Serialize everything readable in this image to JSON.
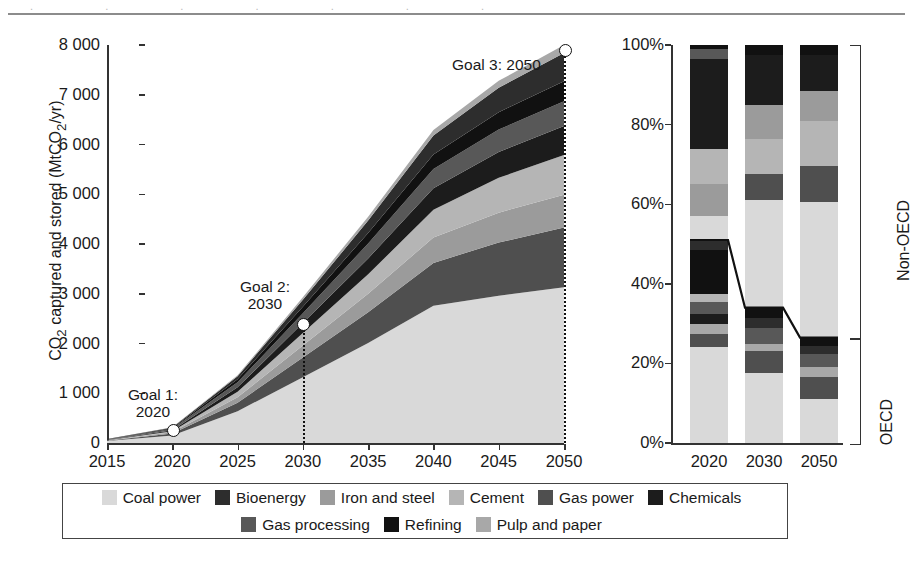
{
  "chart_data": [
    {
      "type": "area",
      "id": "cumulative-ccs-deployment",
      "title": "",
      "xlabel": "",
      "ylabel": "CO2 captured and stored (MtCO2/yr)",
      "ylabel_parts": {
        "pre": "CO",
        "sub1": "2",
        "mid": " captured and stored (MtCO",
        "sub2": "2",
        "post": "/yr)"
      },
      "xlim": [
        2015,
        2050
      ],
      "ylim": [
        0,
        8000
      ],
      "xticks": [
        2015,
        2020,
        2025,
        2030,
        2035,
        2040,
        2045,
        2050
      ],
      "xticklabels": [
        "2015",
        "2020",
        "2025",
        "2030",
        "2035",
        "2040",
        "2045",
        "2050"
      ],
      "yticks": [
        0,
        1000,
        2000,
        3000,
        4000,
        5000,
        6000,
        7000,
        8000
      ],
      "yticklabels": [
        "0",
        "1 000",
        "2 000",
        "3 000",
        "4 000",
        "5 000",
        "6 000",
        "7 000",
        "8 000"
      ],
      "grid": false,
      "stacked": true,
      "x": [
        2015,
        2020,
        2025,
        2030,
        2035,
        2040,
        2045,
        2050
      ],
      "series": [
        {
          "name": "Coal power",
          "color": "#d9d9d9",
          "values": [
            40,
            150,
            640,
            1320,
            2010,
            2760,
            2960,
            3130
          ]
        },
        {
          "name": "Gas power",
          "color": "#4f4f4f",
          "values": [
            5,
            40,
            170,
            400,
            620,
            860,
            1070,
            1200
          ]
        },
        {
          "name": "Iron and steel",
          "color": "#9b9b9b",
          "values": [
            5,
            25,
            110,
            240,
            370,
            510,
            600,
            660
          ]
        },
        {
          "name": "Cement",
          "color": "#b5b5b5",
          "values": [
            5,
            20,
            110,
            250,
            390,
            560,
            700,
            800
          ]
        },
        {
          "name": "Chemicals",
          "color": "#1c1c1c",
          "values": [
            5,
            20,
            90,
            200,
            320,
            430,
            520,
            580
          ]
        },
        {
          "name": "Gas processing",
          "color": "#585858",
          "values": [
            10,
            30,
            100,
            200,
            300,
            390,
            450,
            500
          ]
        },
        {
          "name": "Refining",
          "color": "#111111",
          "values": [
            5,
            15,
            60,
            130,
            210,
            290,
            350,
            400
          ]
        },
        {
          "name": "Bioenergy",
          "color": "#2d2d2d",
          "values": [
            5,
            10,
            60,
            140,
            250,
            380,
            490,
            570
          ]
        },
        {
          "name": "Pulp and paper",
          "color": "#a8a8a8",
          "values": [
            0,
            5,
            20,
            50,
            80,
            110,
            140,
            160
          ]
        }
      ],
      "annotations": [
        {
          "name": "goal-1",
          "label": "Goal 1:\n2020",
          "x": 2020,
          "y": 280,
          "label_text_1": "Goal 1:",
          "label_text_2": "2020"
        },
        {
          "name": "goal-2",
          "label": "Goal 2:\n2030",
          "x": 2030,
          "y": 2400,
          "label_text_1": "Goal 2:",
          "label_text_2": "2030"
        },
        {
          "name": "goal-3",
          "label": "Goal 3: 2050",
          "x": 2050,
          "y": 7900,
          "label_text_1": "Goal 3: 2050",
          "label_text_2": ""
        }
      ]
    },
    {
      "type": "bar",
      "id": "regional-share-of-capture",
      "title": "",
      "stacked": true,
      "normalized": true,
      "categories": [
        "2020",
        "2030",
        "2050"
      ],
      "ylim": [
        0,
        100
      ],
      "yticks": [
        0,
        20,
        40,
        60,
        80,
        100
      ],
      "yticklabels": [
        "0%",
        "20%",
        "40%",
        "60%",
        "80%",
        "100%"
      ],
      "grid": false,
      "stack_order_note": "bottom-to-top: OECD block then Non-OECD block",
      "oecd_share": [
        51,
        34,
        26.5
      ],
      "bars": [
        {
          "category": "2020",
          "segments": [
            {
              "name": "Coal power",
              "color": "#d9d9d9",
              "value": 24.0
            },
            {
              "name": "Gas power",
              "color": "#4f4f4f",
              "value": 3.5
            },
            {
              "name": "Pulp and paper",
              "color": "#a8a8a8",
              "value": 2.5
            },
            {
              "name": "Chemicals",
              "color": "#1c1c1c",
              "value": 2.5
            },
            {
              "name": "Gas processing",
              "color": "#585858",
              "value": 3.0
            },
            {
              "name": "Cement",
              "color": "#b5b5b5",
              "value": 2.0
            },
            {
              "name": "Refining",
              "color": "#111111",
              "value": 11.0
            },
            {
              "name": "Bioenergy",
              "color": "#2d2d2d",
              "value": 2.5
            },
            {
              "name": "Coal power",
              "color": "#d9d9d9",
              "value": 6.0
            },
            {
              "name": "Iron and steel",
              "color": "#9b9b9b",
              "value": 8.0
            },
            {
              "name": "Cement",
              "color": "#b5b5b5",
              "value": 9.0
            },
            {
              "name": "Chemicals",
              "color": "#1c1c1c",
              "value": 22.5
            },
            {
              "name": "Gas processing",
              "color": "#585858",
              "value": 2.5
            },
            {
              "name": "Refining",
              "color": "#111111",
              "value": 1.0
            }
          ]
        },
        {
          "category": "2030",
          "segments": [
            {
              "name": "Coal power",
              "color": "#d9d9d9",
              "value": 17.5
            },
            {
              "name": "Gas power",
              "color": "#4f4f4f",
              "value": 5.5
            },
            {
              "name": "Pulp and paper",
              "color": "#a8a8a8",
              "value": 2.0
            },
            {
              "name": "Gas processing",
              "color": "#585858",
              "value": 4.0
            },
            {
              "name": "Bioenergy",
              "color": "#2d2d2d",
              "value": 2.5
            },
            {
              "name": "Refining",
              "color": "#111111",
              "value": 2.5
            },
            {
              "name": "Coal power",
              "color": "#d9d9d9",
              "value": 27.0
            },
            {
              "name": "Gas power",
              "color": "#4f4f4f",
              "value": 6.5
            },
            {
              "name": "Cement",
              "color": "#b5b5b5",
              "value": 9.0
            },
            {
              "name": "Iron and steel",
              "color": "#9b9b9b",
              "value": 8.5
            },
            {
              "name": "Chemicals",
              "color": "#1c1c1c",
              "value": 12.5
            },
            {
              "name": "Refining",
              "color": "#111111",
              "value": 2.5
            }
          ]
        },
        {
          "category": "2050",
          "segments": [
            {
              "name": "Coal power",
              "color": "#d9d9d9",
              "value": 11.0
            },
            {
              "name": "Gas power",
              "color": "#4f4f4f",
              "value": 5.5
            },
            {
              "name": "Pulp and paper",
              "color": "#a8a8a8",
              "value": 2.5
            },
            {
              "name": "Gas processing",
              "color": "#585858",
              "value": 3.5
            },
            {
              "name": "Bioenergy",
              "color": "#2d2d2d",
              "value": 2.0
            },
            {
              "name": "Refining",
              "color": "#111111",
              "value": 2.0
            },
            {
              "name": "Coal power",
              "color": "#d9d9d9",
              "value": 34.0
            },
            {
              "name": "Gas power",
              "color": "#4f4f4f",
              "value": 9.0
            },
            {
              "name": "Cement",
              "color": "#b5b5b5",
              "value": 11.5
            },
            {
              "name": "Iron and steel",
              "color": "#9b9b9b",
              "value": 7.5
            },
            {
              "name": "Chemicals",
              "color": "#1c1c1c",
              "value": 9.0
            },
            {
              "name": "Refining",
              "color": "#111111",
              "value": 2.5
            }
          ]
        }
      ],
      "brackets": [
        {
          "name": "non-oecd-bracket",
          "label": "Non-OECD",
          "from": 26.5,
          "to": 100
        },
        {
          "name": "oecd-bracket",
          "label": "OECD",
          "from": 0,
          "to": 26.5
        }
      ]
    }
  ],
  "legend": {
    "position": "bottom",
    "rows": [
      [
        {
          "label": "Coal power",
          "color": "#d9d9d9"
        },
        {
          "label": "Bioenergy",
          "color": "#2d2d2d"
        },
        {
          "label": "Iron and steel",
          "color": "#9b9b9b"
        },
        {
          "label": "Cement",
          "color": "#b5b5b5"
        },
        {
          "label": "Gas power",
          "color": "#4f4f4f"
        },
        {
          "label": "Chemicals",
          "color": "#1c1c1c"
        }
      ],
      [
        {
          "label": "Gas processing",
          "color": "#585858"
        },
        {
          "label": "Refining",
          "color": "#111111"
        },
        {
          "label": "Pulp and paper",
          "color": "#a8a8a8"
        }
      ]
    ]
  }
}
